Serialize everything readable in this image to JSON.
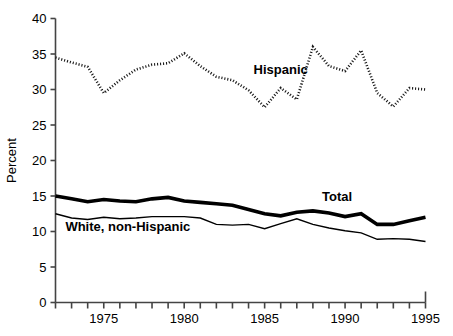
{
  "chart_data": {
    "type": "line",
    "title": "",
    "xlabel": "",
    "ylabel": "Percent",
    "xlim": [
      1972,
      1995
    ],
    "ylim": [
      0,
      40
    ],
    "ytick_values": [
      0,
      5,
      10,
      15,
      20,
      25,
      30,
      35,
      40
    ],
    "ytick_labels": [
      "0",
      "5",
      "10",
      "15",
      "20",
      "25",
      "30",
      "35",
      "40"
    ],
    "xtick_values": [
      1972,
      1973,
      1974,
      1975,
      1976,
      1977,
      1978,
      1979,
      1980,
      1981,
      1982,
      1983,
      1984,
      1985,
      1986,
      1987,
      1988,
      1989,
      1990,
      1991,
      1992,
      1993,
      1994,
      1995
    ],
    "xtick_labels_shown": [
      "1975",
      "1980",
      "1985",
      "1990",
      "1995"
    ],
    "xtick_labeled_values": [
      1975,
      1980,
      1985,
      1990,
      1995
    ],
    "grid": false,
    "legend_position": "inline-annotations",
    "x": [
      1972,
      1973,
      1974,
      1975,
      1976,
      1977,
      1978,
      1979,
      1980,
      1981,
      1982,
      1983,
      1984,
      1985,
      1986,
      1987,
      1988,
      1989,
      1990,
      1991,
      1992,
      1993,
      1994,
      1995
    ],
    "series": [
      {
        "name": "Hispanic",
        "style": "dotted",
        "color": "#1a1a1a",
        "linewidth": 2.6,
        "label_text": "Hispanic",
        "values": [
          34.5,
          33.8,
          33.2,
          29.5,
          31.3,
          32.8,
          33.5,
          33.7,
          35.1,
          33.3,
          31.8,
          31.3,
          29.9,
          27.5,
          30.2,
          28.6,
          36.0,
          33.3,
          32.6,
          35.5,
          29.5,
          27.6,
          30.2,
          30.0
        ],
        "annotation": {
          "x": 1986.0,
          "y": 32.2
        }
      },
      {
        "name": "Total",
        "style": "solid-thick",
        "color": "#000000",
        "linewidth": 3.6,
        "label_text": "Total",
        "values": [
          15.0,
          14.6,
          14.2,
          14.5,
          14.3,
          14.2,
          14.6,
          14.8,
          14.3,
          14.1,
          13.9,
          13.7,
          13.1,
          12.5,
          12.2,
          12.7,
          12.9,
          12.6,
          12.1,
          12.5,
          11.0,
          11.0,
          11.5,
          12.0
        ],
        "annotation": {
          "x": 1989.5,
          "y": 14.3
        }
      },
      {
        "name": "White, non-Hispanic",
        "style": "solid-thin",
        "color": "#000000",
        "linewidth": 1.4,
        "label_text": "White, non-Hispanic",
        "values": [
          12.5,
          11.9,
          11.7,
          12.0,
          11.8,
          11.9,
          12.1,
          12.1,
          12.1,
          11.9,
          11.0,
          10.9,
          11.0,
          10.4,
          11.1,
          11.8,
          11.0,
          10.5,
          10.1,
          9.8,
          8.9,
          9.0,
          8.9,
          8.6
        ],
        "annotation": {
          "x": 1976.5,
          "y": 10.1
        }
      }
    ]
  },
  "axis": {
    "ylabel": "Percent"
  }
}
